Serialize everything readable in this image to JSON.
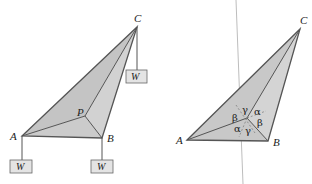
{
  "figure": {
    "left_diagram": {
      "vertices": {
        "A": {
          "label": "A",
          "x": 22,
          "y": 136
        },
        "B": {
          "label": "B",
          "x": 102,
          "y": 138
        },
        "C": {
          "label": "C",
          "x": 137,
          "y": 27
        },
        "P": {
          "label": "P",
          "x": 85,
          "y": 116
        }
      },
      "weights": [
        {
          "label": "W",
          "attached_to": "C"
        },
        {
          "label": "W",
          "attached_to": "A"
        },
        {
          "label": "W",
          "attached_to": "B"
        }
      ]
    },
    "right_diagram": {
      "vertices": {
        "A": {
          "label": "A",
          "x": 187,
          "y": 140
        },
        "B": {
          "label": "B",
          "x": 268,
          "y": 141
        },
        "C": {
          "label": "C",
          "x": 300,
          "y": 29
        }
      },
      "angles": [
        {
          "label": "γ",
          "position": "top"
        },
        {
          "label": "α",
          "position": "upper-right"
        },
        {
          "label": "β",
          "position": "left"
        },
        {
          "label": "β",
          "position": "right"
        },
        {
          "label": "α",
          "position": "lower-left"
        },
        {
          "label": "γ",
          "position": "bottom"
        }
      ]
    },
    "colors": {
      "fill": "#c8c8c8",
      "fill_light": "#d6d6d6",
      "stroke": "#555555",
      "weight_fill": "#e4e4e4",
      "divider": "#bdbdbd"
    }
  }
}
